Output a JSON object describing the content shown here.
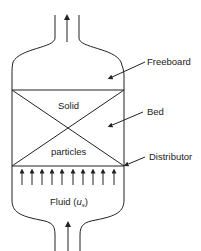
{
  "diagram": {
    "labels": {
      "freeboard": "Freeboard",
      "bed": "Bed",
      "distributor": "Distributor",
      "solid": "Solid",
      "particles": "particles",
      "fluid_prefix": "Fluid (",
      "fluid_symbol": "u",
      "fluid_subscript": "s",
      "fluid_suffix": ")"
    },
    "arrow_count": 10,
    "colors": {
      "line": "#222222",
      "background": "#ffffff"
    }
  }
}
